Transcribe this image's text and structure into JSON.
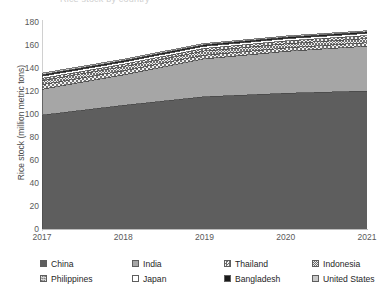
{
  "title_sliver": "Rice stock by country",
  "axis": {
    "y_title": "Rice stock (million metric tons)",
    "y_ticks": [
      "180",
      "160",
      "140",
      "120",
      "100",
      "80",
      "60",
      "40",
      "20",
      "0"
    ],
    "x_ticks": [
      "2017",
      "2018",
      "2019",
      "2020",
      "2021"
    ]
  },
  "legend": {
    "items": [
      {
        "label": "China",
        "swatch": "solid-dark-gray",
        "color": "#5e5e5e"
      },
      {
        "label": "India",
        "swatch": "solid-mid-gray",
        "color": "#a6a6a6"
      },
      {
        "label": "Thailand",
        "swatch": "checker-hatch",
        "color": "#8c8c8c"
      },
      {
        "label": "Indonesia",
        "swatch": "dense-hatch",
        "color": "#9a9a9a"
      },
      {
        "label": "Philippines",
        "swatch": "cross-hatch",
        "color": "#8f8f8f"
      },
      {
        "label": "Japan",
        "swatch": "empty-white",
        "color": "#ffffff"
      },
      {
        "label": "Bangladesh",
        "swatch": "solid-black",
        "color": "#1a1a1a"
      },
      {
        "label": "United States",
        "swatch": "solid-light-gray",
        "color": "#c9c9c9"
      }
    ]
  },
  "chart_data": {
    "type": "area",
    "stacked": true,
    "title": "Rice stock by country",
    "xlabel": "",
    "ylabel": "Rice stock (million metric tons)",
    "x": [
      2017,
      2018,
      2019,
      2020,
      2021
    ],
    "ylim": [
      0,
      180
    ],
    "ytick_step": 20,
    "grid": false,
    "legend_position": "bottom",
    "series": [
      {
        "name": "China",
        "values": [
          99.0,
          107.5,
          115.0,
          118.0,
          120.0
        ]
      },
      {
        "name": "India",
        "values": [
          22.5,
          26.5,
          33.0,
          36.5,
          39.0
        ]
      },
      {
        "name": "Thailand",
        "values": [
          4.0,
          3.6,
          3.2,
          3.0,
          3.0
        ]
      },
      {
        "name": "Indonesia",
        "values": [
          3.6,
          3.6,
          3.6,
          3.6,
          3.6
        ]
      },
      {
        "name": "Philippines",
        "values": [
          1.9,
          2.0,
          2.3,
          2.5,
          2.6
        ]
      },
      {
        "name": "Japan",
        "values": [
          1.9,
          1.9,
          1.9,
          1.9,
          1.9
        ]
      },
      {
        "name": "Bangladesh",
        "values": [
          1.3,
          1.3,
          1.3,
          1.3,
          1.3
        ]
      },
      {
        "name": "United States",
        "values": [
          1.3,
          1.2,
          1.1,
          1.0,
          1.0
        ]
      }
    ],
    "stack_totals": [
      135.5,
      147.6,
      161.4,
      167.8,
      172.4
    ]
  }
}
